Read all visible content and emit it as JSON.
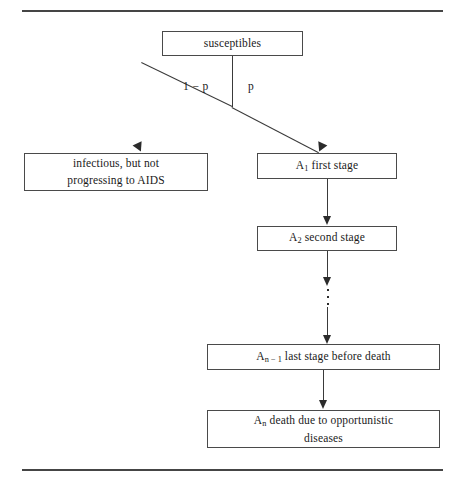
{
  "figure": {
    "type": "flowchart",
    "topic": "HIV infection progression model",
    "rules": {
      "top_label": "top-horizontal-rule",
      "bottom_label": "bottom-horizontal-rule"
    }
  },
  "nodes": {
    "susceptibles": {
      "text": "susceptibles"
    },
    "infectious": {
      "line1": "infectious, but not",
      "line2": "progressing to AIDS"
    },
    "stage1": {
      "symbol": "A",
      "subscript": "1",
      "text": " first stage"
    },
    "stage2": {
      "symbol": "A",
      "subscript": "2",
      "text": " second stage"
    },
    "stage_last": {
      "symbol": "A",
      "subscript": "n − 1",
      "text": " last stage before death"
    },
    "stage_death": {
      "symbol": "A",
      "subscript": "n",
      "line1": " death due to opportunistic",
      "line2": "diseases"
    }
  },
  "edges": {
    "branch_left_label": "1 − p",
    "branch_right_label": "p",
    "ellipsis_glyph": "⋮"
  },
  "colors": {
    "rule": "#454545",
    "box_border": "#4a4a4a",
    "connector": "#3a3a3a",
    "arrowhead": "#2b2b2b",
    "text": "#1a1a1a",
    "background": "#ffffff"
  }
}
